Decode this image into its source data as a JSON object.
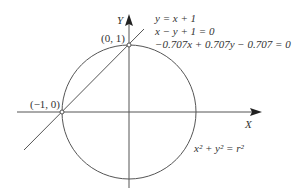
{
  "diagram": {
    "axes": {
      "x_label": "X",
      "y_label": "Y"
    },
    "points": [
      {
        "label": "(0, 1)"
      },
      {
        "label": "(−1, 0)"
      }
    ],
    "equations": {
      "line_1": "y = x + 1",
      "line_2": "x − y + 1 = 0",
      "line_3": "−0.707x + 0.707y − 0.707 = 0",
      "circle": "x² + y² = r²"
    },
    "colors": {
      "stroke": "#555555",
      "text": "#333333"
    }
  }
}
